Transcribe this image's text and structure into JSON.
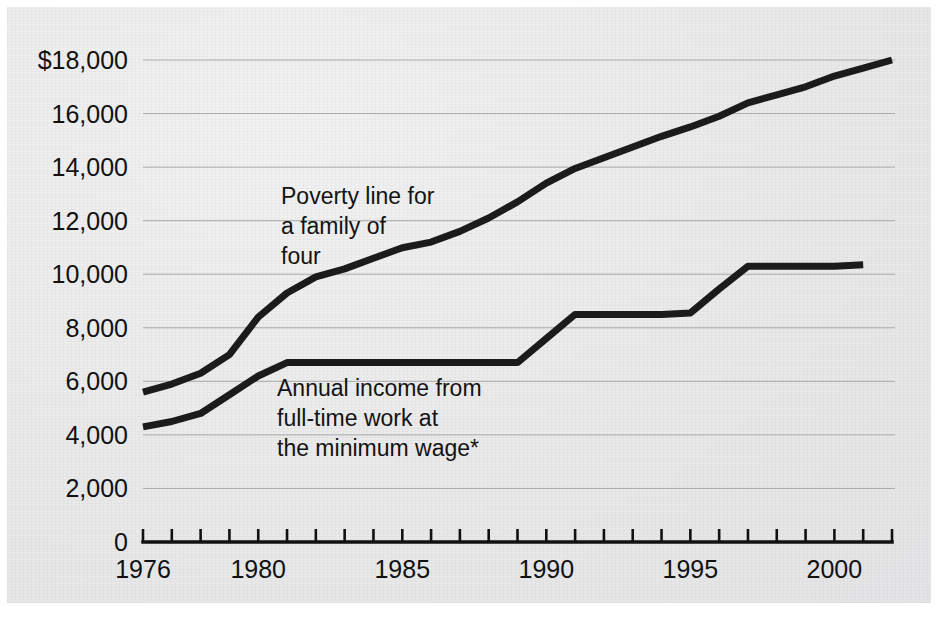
{
  "figure": {
    "background_color": "#ececed",
    "ink_color": "#1b1b1b",
    "gridline_color": "#a9a9ad"
  },
  "chart_data": {
    "type": "line",
    "title": "",
    "xlabel": "",
    "ylabel": "",
    "xlim": [
      1976,
      2002
    ],
    "ylim": [
      0,
      18000
    ],
    "grid": true,
    "legend": "inline annotations",
    "y_ticks": [
      0,
      2000,
      4000,
      6000,
      8000,
      10000,
      12000,
      14000,
      16000,
      18000
    ],
    "y_tick_labels": [
      "0",
      "2,000",
      "4,000",
      "6,000",
      "8,000",
      "10,000",
      "12,000",
      "14,000",
      "16,000",
      "$18,000"
    ],
    "x_ticks": [
      1976,
      1977,
      1978,
      1979,
      1980,
      1981,
      1982,
      1983,
      1984,
      1985,
      1986,
      1987,
      1988,
      1989,
      1990,
      1991,
      1992,
      1993,
      1994,
      1995,
      1996,
      1997,
      1998,
      1999,
      2000,
      2001,
      2002
    ],
    "x_tick_labels": [
      "1976",
      "1980",
      "1985",
      "1990",
      "1995",
      "2000"
    ],
    "x_labeled_years": [
      1976,
      1980,
      1985,
      1990,
      1995,
      2000
    ],
    "series": [
      {
        "name": "Poverty line for a family of four",
        "x": [
          1976,
          1977,
          1978,
          1979,
          1980,
          1981,
          1982,
          1983,
          1984,
          1985,
          1986,
          1987,
          1988,
          1989,
          1990,
          1991,
          1992,
          1993,
          1994,
          1995,
          1996,
          1997,
          1998,
          1999,
          2000,
          2001,
          2002
        ],
        "values": [
          5600,
          5900,
          6300,
          7000,
          8400,
          9300,
          9900,
          10200,
          10600,
          10990,
          11200,
          11600,
          12100,
          12700,
          13400,
          13950,
          14350,
          14750,
          15150,
          15500,
          15900,
          16400,
          16700,
          17000,
          17400,
          17700,
          18000
        ]
      },
      {
        "name": "Annual income from full-time work at the minimum wage*",
        "x": [
          1976,
          1977,
          1978,
          1979,
          1980,
          1981,
          1982,
          1983,
          1984,
          1985,
          1986,
          1987,
          1988,
          1989,
          1990,
          1991,
          1992,
          1993,
          1994,
          1995,
          1996,
          1997,
          1998,
          1999,
          2000,
          2001
        ],
        "values": [
          4300,
          4500,
          4800,
          5500,
          6200,
          6700,
          6700,
          6700,
          6700,
          6700,
          6700,
          6700,
          6700,
          6700,
          7600,
          8500,
          8500,
          8500,
          8500,
          8550,
          9450,
          10300,
          10300,
          10300,
          10300,
          10350
        ]
      }
    ],
    "annotations": [
      {
        "id": "poverty-line-annotation",
        "lines": [
          "Poverty line for",
          "a family of",
          "four"
        ],
        "x_px": 281,
        "y_px": 204
      },
      {
        "id": "minimum-wage-annotation",
        "lines": [
          "Annual income from",
          "full-time work at",
          "the minimum wage*"
        ],
        "x_px": 277,
        "y_px": 396
      }
    ]
  }
}
